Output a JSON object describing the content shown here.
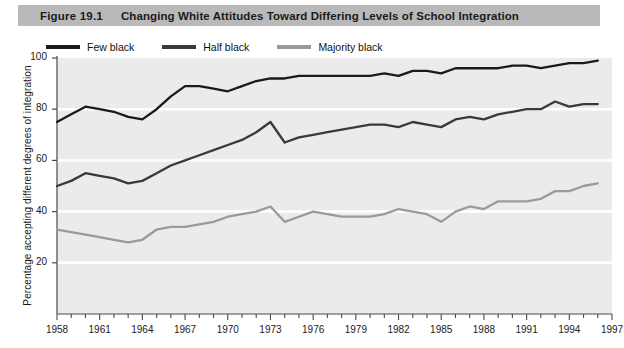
{
  "caption": {
    "figure_number": "Figure 19.1",
    "title": "Changing White Attitudes Toward Differing Levels of School Integration"
  },
  "colors": {
    "caption_band": "#b9b9b9",
    "plot_background": "#ebebeb",
    "gridline": "#ffffff",
    "axis": "#4a4a4a",
    "few_black": "#1a1a1a",
    "half_black": "#3a3a3a",
    "majority_black": "#9a9a9a"
  },
  "legend": {
    "position": "top-left",
    "items": [
      {
        "label": "Few black",
        "color": "#1a1a1a"
      },
      {
        "label": "Half black",
        "color": "#3a3a3a"
      },
      {
        "label": "Majority black",
        "color": "#9a9a9a"
      }
    ]
  },
  "chart_data": {
    "type": "line",
    "title": "Changing White Attitudes Toward Differing Levels of School Integration",
    "xlabel": "",
    "ylabel": "Percentage accepting different degrees of integration",
    "xlim": [
      1958,
      1997
    ],
    "ylim": [
      0,
      100
    ],
    "ytick_values": [
      20,
      40,
      60,
      80,
      100
    ],
    "ytick_labels": [
      "20",
      "40",
      "60",
      "80",
      "100"
    ],
    "xtick_labels": [
      "1958",
      "1961",
      "1964",
      "1967",
      "1970",
      "1973",
      "1976",
      "1979",
      "1982",
      "1985",
      "1988",
      "1991",
      "1994",
      "1997"
    ],
    "xtick_values": [
      1958,
      1961,
      1964,
      1967,
      1970,
      1973,
      1976,
      1979,
      1982,
      1985,
      1988,
      1991,
      1994,
      1997
    ],
    "minor_xticks_every": 1,
    "grid": true,
    "grid_axis": "y",
    "x": [
      1958,
      1959,
      1960,
      1961,
      1962,
      1963,
      1964,
      1965,
      1966,
      1967,
      1968,
      1969,
      1970,
      1971,
      1972,
      1973,
      1974,
      1975,
      1976,
      1977,
      1978,
      1979,
      1980,
      1981,
      1982,
      1983,
      1984,
      1985,
      1986,
      1987,
      1988,
      1989,
      1990,
      1991,
      1992,
      1993,
      1994,
      1995,
      1996
    ],
    "series": [
      {
        "name": "Few black",
        "color": "#1a1a1a",
        "values": [
          75,
          78,
          81,
          80,
          79,
          77,
          76,
          80,
          85,
          89,
          89,
          88,
          87,
          89,
          91,
          92,
          92,
          93,
          93,
          93,
          93,
          93,
          93,
          94,
          93,
          95,
          95,
          94,
          96,
          96,
          96,
          96,
          97,
          97,
          96,
          97,
          98,
          98,
          99
        ]
      },
      {
        "name": "Half black",
        "color": "#3a3a3a",
        "values": [
          50,
          52,
          55,
          54,
          53,
          51,
          52,
          55,
          58,
          60,
          62,
          64,
          66,
          68,
          71,
          75,
          67,
          69,
          70,
          71,
          72,
          73,
          74,
          74,
          73,
          75,
          74,
          73,
          76,
          77,
          76,
          78,
          79,
          80,
          80,
          83,
          81,
          82,
          82
        ]
      },
      {
        "name": "Majority black",
        "color": "#9a9a9a",
        "values": [
          33,
          32,
          31,
          30,
          29,
          28,
          29,
          33,
          34,
          34,
          35,
          36,
          38,
          39,
          40,
          42,
          36,
          38,
          40,
          39,
          38,
          38,
          38,
          39,
          41,
          40,
          39,
          36,
          40,
          42,
          41,
          44,
          44,
          44,
          45,
          48,
          48,
          50,
          51
        ]
      }
    ]
  }
}
